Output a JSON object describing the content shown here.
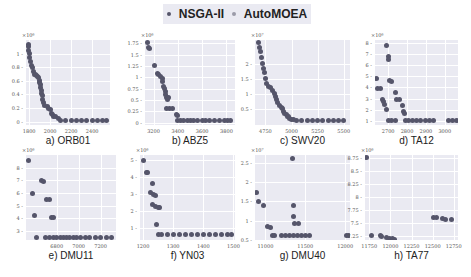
{
  "legend": {
    "items": [
      {
        "label": "NSGA-II",
        "color": "#55556a"
      },
      {
        "label": "AutoMOEA",
        "color": "#9a9aa8"
      }
    ]
  },
  "colors": {
    "plot_bg": "#eaeaf2",
    "point": "#55556a",
    "grid": "#ffffff"
  },
  "chart_data": [
    {
      "type": "scatter",
      "title": "a) ORB01",
      "y_exponent": "×10⁶",
      "xlim": [
        1770,
        2570
      ],
      "ylim": [
        -0.05,
        1.2
      ],
      "xticks": [
        1800,
        2000,
        2200,
        2400
      ],
      "yticks": [
        0.0,
        0.2,
        0.4,
        0.6,
        0.8,
        1.0
      ],
      "points": [
        [
          1790,
          1.13
        ],
        [
          1792,
          1.1
        ],
        [
          1795,
          1.05
        ],
        [
          1800,
          1.0
        ],
        [
          1805,
          0.95
        ],
        [
          1810,
          0.88
        ],
        [
          1820,
          0.82
        ],
        [
          1830,
          0.8
        ],
        [
          1840,
          0.74
        ],
        [
          1850,
          0.7
        ],
        [
          1860,
          0.7
        ],
        [
          1870,
          0.68
        ],
        [
          1880,
          0.66
        ],
        [
          1890,
          0.65
        ],
        [
          1895,
          0.6
        ],
        [
          1900,
          0.58
        ],
        [
          1905,
          0.55
        ],
        [
          1910,
          0.5
        ],
        [
          1915,
          0.46
        ],
        [
          1920,
          0.42
        ],
        [
          1925,
          0.38
        ],
        [
          1930,
          0.32
        ],
        [
          1940,
          0.28
        ],
        [
          1950,
          0.24
        ],
        [
          1970,
          0.22
        ],
        [
          1980,
          0.2
        ],
        [
          2000,
          0.18
        ],
        [
          2010,
          0.12
        ],
        [
          2020,
          0.1
        ],
        [
          2030,
          0.08
        ],
        [
          2050,
          0.07
        ],
        [
          2080,
          0.05
        ],
        [
          2100,
          0.02
        ],
        [
          2150,
          0.02
        ],
        [
          2200,
          0.02
        ],
        [
          2250,
          0.02
        ],
        [
          2300,
          0.02
        ],
        [
          2350,
          0.02
        ],
        [
          2400,
          0.02
        ],
        [
          2450,
          0.02
        ],
        [
          2500,
          0.02
        ],
        [
          2540,
          0.02
        ]
      ]
    },
    {
      "type": "scatter",
      "title": "b) ABZ5",
      "y_exponent": "×10⁶",
      "xlim": [
        3130,
        3870
      ],
      "ylim": [
        -0.05,
        1.82
      ],
      "xticks": [
        3200,
        3400,
        3600,
        3800
      ],
      "yticks": [
        0.0,
        0.25,
        0.5,
        0.75,
        1.0,
        1.25,
        1.5,
        1.75
      ],
      "points": [
        [
          3150,
          1.76
        ],
        [
          3160,
          1.66
        ],
        [
          3170,
          1.63
        ],
        [
          3210,
          1.25
        ],
        [
          3230,
          1.08
        ],
        [
          3245,
          1.06
        ],
        [
          3260,
          1.02
        ],
        [
          3270,
          0.97
        ],
        [
          3275,
          0.9
        ],
        [
          3280,
          0.8
        ],
        [
          3290,
          0.75
        ],
        [
          3295,
          0.68
        ],
        [
          3300,
          0.63
        ],
        [
          3305,
          0.55
        ],
        [
          3315,
          0.52
        ],
        [
          3320,
          0.55
        ],
        [
          3310,
          0.32
        ],
        [
          3330,
          0.32
        ],
        [
          3360,
          0.32
        ],
        [
          3385,
          0.18
        ],
        [
          3395,
          0.17
        ],
        [
          3400,
          0.05
        ],
        [
          3420,
          0.05
        ],
        [
          3450,
          0.05
        ],
        [
          3480,
          0.05
        ],
        [
          3500,
          0.05
        ],
        [
          3530,
          0.05
        ],
        [
          3560,
          0.05
        ],
        [
          3600,
          0.05
        ],
        [
          3630,
          0.05
        ],
        [
          3660,
          0.05
        ],
        [
          3700,
          0.05
        ],
        [
          3740,
          0.05
        ],
        [
          3780,
          0.05
        ],
        [
          3810,
          0.05
        ],
        [
          3830,
          0.05
        ]
      ]
    },
    {
      "type": "scatter",
      "title": "c) SWV20",
      "y_exponent": "×10⁷",
      "xlim": [
        4650,
        5560
      ],
      "ylim": [
        -0.05,
        2.8
      ],
      "xticks": [
        4750,
        5000,
        5250,
        5500
      ],
      "yticks": [
        0.5,
        1.0,
        1.5,
        2.0
      ],
      "points": [
        [
          4680,
          2.7
        ],
        [
          4690,
          2.55
        ],
        [
          4700,
          2.4
        ],
        [
          4710,
          2.2
        ],
        [
          4720,
          2.0
        ],
        [
          4730,
          1.85
        ],
        [
          4740,
          1.7
        ],
        [
          4750,
          1.5
        ],
        [
          4760,
          1.35
        ],
        [
          4780,
          1.25
        ],
        [
          4800,
          1.2
        ],
        [
          4820,
          1.1
        ],
        [
          4840,
          1.0
        ],
        [
          4850,
          0.9
        ],
        [
          4860,
          0.8
        ],
        [
          4870,
          0.7
        ],
        [
          4880,
          0.62
        ],
        [
          4900,
          0.55
        ],
        [
          4910,
          0.5
        ],
        [
          4920,
          0.4
        ],
        [
          4930,
          0.35
        ],
        [
          4950,
          0.3
        ],
        [
          4960,
          0.25
        ],
        [
          4970,
          0.22
        ],
        [
          4980,
          0.18
        ],
        [
          5000,
          0.15
        ],
        [
          5020,
          0.12
        ],
        [
          5050,
          0.1
        ],
        [
          5100,
          0.1
        ],
        [
          5150,
          0.1
        ],
        [
          5200,
          0.1
        ],
        [
          5250,
          0.1
        ],
        [
          5300,
          0.1
        ],
        [
          5350,
          0.1
        ],
        [
          5400,
          0.1
        ],
        [
          5450,
          0.1
        ],
        [
          5500,
          0.1
        ]
      ]
    },
    {
      "type": "scatter",
      "title": "d) TA12",
      "y_exponent": "×10⁶",
      "xlim": [
        2630,
        3070
      ],
      "ylim": [
        0.6,
        8.3
      ],
      "xticks": [
        2700,
        2800,
        2900,
        3000
      ],
      "yticks": [
        1,
        2,
        3,
        4,
        5,
        6,
        7,
        8
      ],
      "points": [
        [
          2640,
          4.8
        ],
        [
          2645,
          3.9
        ],
        [
          2660,
          3.9
        ],
        [
          2670,
          2.9
        ],
        [
          2675,
          2.7
        ],
        [
          2680,
          2.5
        ],
        [
          2690,
          2.0
        ],
        [
          2690,
          7.8
        ],
        [
          2700,
          6.8
        ],
        [
          2700,
          6.5
        ],
        [
          2705,
          4.6
        ],
        [
          2715,
          4.5
        ],
        [
          2740,
          3.5
        ],
        [
          2745,
          2.9
        ],
        [
          2760,
          2.9
        ],
        [
          2775,
          2.4
        ],
        [
          2780,
          1.8
        ],
        [
          2785,
          1.6
        ],
        [
          2700,
          1.0
        ],
        [
          2720,
          1.0
        ],
        [
          2740,
          1.0
        ],
        [
          2790,
          1.0
        ],
        [
          2810,
          1.0
        ],
        [
          2830,
          1.0
        ],
        [
          2850,
          1.0
        ],
        [
          2870,
          1.0
        ],
        [
          2900,
          1.0
        ],
        [
          2920,
          1.0
        ],
        [
          2940,
          1.0
        ],
        [
          3020,
          1.0
        ],
        [
          3040,
          1.0
        ],
        [
          3060,
          1.0
        ]
      ]
    },
    {
      "type": "scatter",
      "title": "e) DMU11",
      "y_exponent": "×10⁶",
      "xlim": [
        6520,
        7340
      ],
      "ylim": [
        2.3,
        9.0
      ],
      "xticks": [
        6800,
        7000,
        7200
      ],
      "yticks": [
        3,
        4,
        5,
        6,
        7,
        8
      ],
      "points": [
        [
          6540,
          8.6
        ],
        [
          6580,
          6.0
        ],
        [
          6595,
          4.2
        ],
        [
          6660,
          7.0
        ],
        [
          6680,
          6.9
        ],
        [
          6710,
          5.5
        ],
        [
          6730,
          5.5
        ],
        [
          6750,
          4.1
        ],
        [
          6770,
          4.1
        ],
        [
          6620,
          2.5
        ],
        [
          6700,
          2.5
        ],
        [
          6730,
          2.5
        ],
        [
          6770,
          2.5
        ],
        [
          6800,
          2.5
        ],
        [
          6830,
          2.5
        ],
        [
          6860,
          2.5
        ],
        [
          6890,
          2.5
        ],
        [
          6920,
          2.5
        ],
        [
          6950,
          2.5
        ],
        [
          6980,
          2.5
        ],
        [
          7020,
          2.5
        ],
        [
          7060,
          2.5
        ],
        [
          7100,
          2.5
        ],
        [
          7150,
          2.5
        ],
        [
          7200,
          2.5
        ],
        [
          7250,
          2.5
        ],
        [
          7300,
          2.5
        ]
      ]
    },
    {
      "type": "scatter",
      "title": "f) YN03",
      "y_exponent": "×10⁶",
      "xlim": [
        1190,
        1505
      ],
      "ylim": [
        0.3,
        5.3
      ],
      "xticks": [
        1200,
        1300,
        1400,
        1500
      ],
      "yticks": [
        1,
        2,
        3,
        4,
        5
      ],
      "points": [
        [
          1200,
          5.0
        ],
        [
          1210,
          4.3
        ],
        [
          1215,
          4.3
        ],
        [
          1230,
          3.6
        ],
        [
          1225,
          3.1
        ],
        [
          1235,
          3.0
        ],
        [
          1240,
          2.9
        ],
        [
          1230,
          2.4
        ],
        [
          1240,
          2.3
        ],
        [
          1250,
          2.2
        ],
        [
          1255,
          2.2
        ],
        [
          1245,
          1.2
        ],
        [
          1250,
          0.6
        ],
        [
          1260,
          0.6
        ],
        [
          1280,
          0.6
        ],
        [
          1300,
          0.6
        ],
        [
          1320,
          0.6
        ],
        [
          1340,
          0.6
        ],
        [
          1360,
          0.6
        ],
        [
          1380,
          0.6
        ],
        [
          1400,
          0.6
        ],
        [
          1420,
          0.6
        ],
        [
          1440,
          0.6
        ],
        [
          1460,
          0.6
        ],
        [
          1480,
          0.6
        ],
        [
          1495,
          0.6
        ]
      ]
    },
    {
      "type": "scatter",
      "title": "g) DMU40",
      "y_exponent": "×10⁷",
      "xlim": [
        10870,
        12060
      ],
      "ylim": [
        0.5,
        2.7
      ],
      "xticks": [
        11000,
        11500,
        12000
      ],
      "yticks": [
        0.5,
        1.0,
        1.5,
        2.0,
        2.5
      ],
      "points": [
        [
          10890,
          1.72
        ],
        [
          10920,
          1.5
        ],
        [
          10980,
          1.4
        ],
        [
          11030,
          0.84
        ],
        [
          11060,
          0.82
        ],
        [
          11090,
          0.62
        ],
        [
          11110,
          0.62
        ],
        [
          11340,
          2.6
        ],
        [
          11350,
          1.4
        ],
        [
          11350,
          1.11
        ],
        [
          11370,
          0.94
        ],
        [
          11410,
          0.92
        ],
        [
          11200,
          0.62
        ],
        [
          11250,
          0.62
        ],
        [
          11300,
          0.62
        ],
        [
          11350,
          0.62
        ],
        [
          11400,
          0.62
        ],
        [
          11450,
          0.62
        ],
        [
          11500,
          0.62
        ],
        [
          11550,
          0.62
        ],
        [
          12010,
          0.62
        ],
        [
          12040,
          0.62
        ]
      ]
    },
    {
      "type": "scatter",
      "title": "h) TA77",
      "y_exponent": "×10⁶",
      "xlim": [
        11700,
        12800
      ],
      "ylim": [
        7.18,
        8.8
      ],
      "xticks": [
        11750,
        12000,
        12250,
        12500,
        12750
      ],
      "yticks": [
        7.25,
        7.5,
        7.75,
        8.0,
        8.25,
        8.5,
        8.75
      ],
      "points": [
        [
          11720,
          8.75
        ],
        [
          11780,
          7.26
        ],
        [
          11880,
          7.26
        ],
        [
          11900,
          7.25
        ],
        [
          11950,
          7.22
        ],
        [
          11990,
          7.21
        ],
        [
          12020,
          7.2
        ],
        [
          12050,
          7.19
        ],
        [
          12510,
          7.61
        ],
        [
          12540,
          7.6
        ],
        [
          12620,
          7.59
        ],
        [
          12650,
          7.58
        ],
        [
          12720,
          7.57
        ]
      ]
    }
  ]
}
